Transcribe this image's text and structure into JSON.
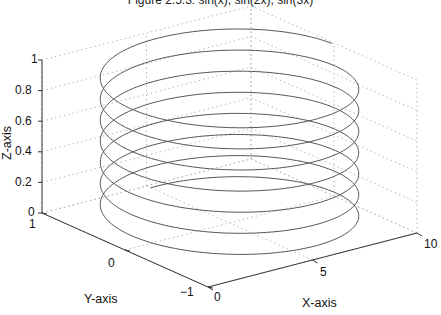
{
  "chart_data": {
    "type": "line3d",
    "title": "Figure 2.5.3: sin(x), sin(2x), sin(3x)",
    "xlabel": "X-axis",
    "ylabel": "Y-axis",
    "zlabel": "Z-axis",
    "xlim": [
      0,
      10
    ],
    "ylim": [
      -1,
      1
    ],
    "zlim": [
      0,
      1
    ],
    "x_ticks": [
      "0",
      "5",
      "10"
    ],
    "y_ticks": [
      "1",
      "0",
      "−1"
    ],
    "z_ticks": [
      "0",
      "0.2",
      "0.4",
      "0.6",
      "0.8",
      "1"
    ],
    "grid": true,
    "grid_style": "dotted",
    "line_color": "#555555",
    "grid_color": "#bbbbbb",
    "series": [
      {
        "name": "3D parametric curve",
        "loops": 7,
        "description": "Elongated loops sweeping across x in [0,10] and y in [-1,1] while rising in z from 0 to 1"
      }
    ]
  },
  "labels": {
    "title": "Figure 2.5.3: sin(x), sin(2x), sin(3x)",
    "x_axis": "X-axis",
    "y_axis": "Y-axis",
    "z_axis": "Z-axis",
    "z_ticks": {
      "t0": "0",
      "t1": "0.2",
      "t2": "0.4",
      "t3": "0.6",
      "t4": "0.8",
      "t5": "1"
    },
    "y_ticks": {
      "t0": "1",
      "t1": "0",
      "t2": "−1"
    },
    "x_ticks": {
      "t0": "0",
      "t1": "5",
      "t2": "10"
    }
  }
}
